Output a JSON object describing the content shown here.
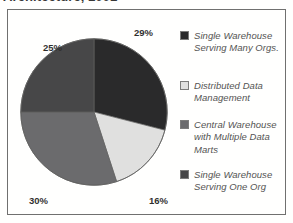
{
  "figure": {
    "title": "Architecture, 2002"
  },
  "chart_data": {
    "type": "pie",
    "title": "Architecture, 2002",
    "xlabel": "",
    "ylabel": "",
    "legend_position": "right",
    "grid": false,
    "start_angle_deg": 0,
    "direction": "clockwise",
    "categories": [
      "Single Warehouse Serving Many Orgs.",
      "Distributed Data Management",
      "Central Warehouse with Multiple Data Marts",
      "Single Warehouse Serving One Org"
    ],
    "values": [
      29,
      16,
      30,
      25
    ],
    "value_labels": [
      "29%",
      "16%",
      "30%",
      "25%"
    ],
    "colors": [
      "#0d0d0f",
      "#dcdcdc",
      "#57575a",
      "#2e2e30"
    ],
    "slices": [
      {
        "label": "Single Warehouse Serving Many Orgs.",
        "value": 29,
        "display": "29%",
        "color": "#0d0d0f"
      },
      {
        "label": "Distributed Data Management",
        "value": 16,
        "display": "16%",
        "color": "#dcdcdc"
      },
      {
        "label": "Central Warehouse with Multiple Data Marts",
        "value": 30,
        "display": "30%",
        "color": "#57575a"
      },
      {
        "label": "Single Warehouse Serving One Org",
        "value": 25,
        "display": "25%",
        "color": "#2e2e30"
      }
    ]
  },
  "legend": {
    "items": [
      {
        "label": "Single Warehouse Serving Many Orgs.",
        "color": "#0d0d0f"
      },
      {
        "label": "Distributed Data Management",
        "color": "#dcdcdc"
      },
      {
        "label": "Central Warehouse with Multiple Data Marts",
        "color": "#57575a"
      },
      {
        "label": "Single Warehouse Serving One Org",
        "color": "#2e2e30"
      }
    ]
  }
}
